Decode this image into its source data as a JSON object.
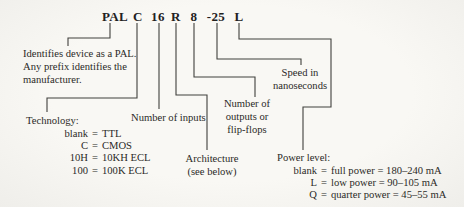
{
  "colors": {
    "paper": "#f6f5f1",
    "ink": "#2b2a27",
    "line": "#41403c"
  },
  "part_number": {
    "tokens": [
      "PAL",
      "C",
      "16",
      "R",
      "8",
      "-25",
      "L"
    ]
  },
  "callouts": {
    "pal": {
      "lines": [
        "Identifies device as a PAL.",
        "Any prefix identifies the",
        "manufacturer."
      ]
    },
    "technology": {
      "title": "Technology:",
      "entries": [
        {
          "key": "blank",
          "eq": "=",
          "value": "TTL"
        },
        {
          "key": "C",
          "eq": "=",
          "value": "CMOS"
        },
        {
          "key": "10H",
          "eq": "=",
          "value": "10KH ECL"
        },
        {
          "key": "100",
          "eq": "=",
          "value": "100K ECL"
        }
      ]
    },
    "inputs": {
      "label": "Number of inputs"
    },
    "architecture": {
      "lines": [
        "Architecture",
        "(see below)"
      ]
    },
    "outputs": {
      "lines": [
        "Number of",
        "outputs or",
        "flip-flops"
      ]
    },
    "speed": {
      "lines": [
        "Speed in",
        "nanoseconds"
      ]
    },
    "power": {
      "title": "Power level:",
      "entries": [
        {
          "key": "blank",
          "eq": "=",
          "value": "full power  = 180–240 mA"
        },
        {
          "key": "L",
          "eq": "=",
          "value": "low power  = 90–105 mA"
        },
        {
          "key": "Q",
          "eq": "=",
          "value": "quarter power  = 45–55 mA"
        }
      ]
    }
  }
}
